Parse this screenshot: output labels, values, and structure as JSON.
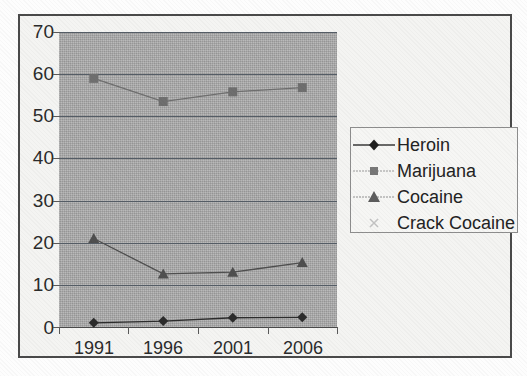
{
  "chart_data": {
    "type": "line",
    "title": "",
    "subtitle": "",
    "xlabel": "",
    "ylabel": "",
    "categories": [
      "1991",
      "1996",
      "2001",
      "2006"
    ],
    "ylim": [
      0,
      70
    ],
    "yticks": [
      0,
      10,
      20,
      30,
      40,
      50,
      60,
      70
    ],
    "ytick_labels": [
      "0",
      "10",
      "20",
      "30",
      "40",
      "50",
      "60",
      "70"
    ],
    "grid": "horizontal",
    "legend_position": "right",
    "plot_background": "#a9a9a9",
    "series": [
      {
        "name": "Heroin",
        "marker": "diamond",
        "color": "#2c2c2c",
        "values": [
          1.0,
          1.4,
          2.2,
          2.3
        ]
      },
      {
        "name": "Marijuana",
        "marker": "square",
        "color": "#6f6f6f",
        "values": [
          59.0,
          53.5,
          55.8,
          56.8
        ]
      },
      {
        "name": "Cocaine",
        "marker": "triangle",
        "color": "#4f4f4f",
        "values": [
          21.0,
          12.6,
          13.0,
          15.3
        ]
      },
      {
        "name": "Crack Cocaine",
        "marker": "cross",
        "color": "#b9b9b9",
        "values": [
          null,
          null,
          null,
          null
        ]
      }
    ]
  },
  "legend": {
    "entries": [
      {
        "label": "Heroin",
        "marker": "diamond"
      },
      {
        "label": "Marijuana",
        "marker": "square"
      },
      {
        "label": "Cocaine",
        "marker": "triangle"
      },
      {
        "label": "Crack Cocaine",
        "marker": "cross"
      }
    ]
  },
  "axes": {
    "y_labels": [
      "70",
      "60",
      "50",
      "40",
      "30",
      "20",
      "10",
      "0"
    ],
    "x_labels": [
      "1991",
      "1996",
      "2001",
      "2006"
    ]
  }
}
